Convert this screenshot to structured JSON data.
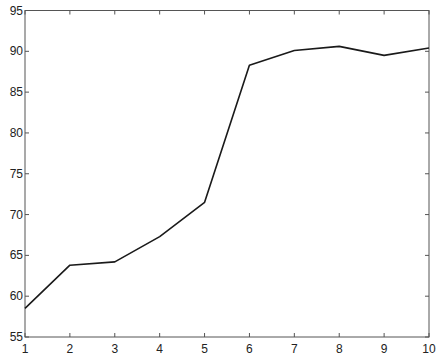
{
  "chart_data": {
    "type": "line",
    "title": "",
    "xlabel": "",
    "ylabel": "",
    "x": [
      1,
      2,
      3,
      4,
      5,
      6,
      7,
      8,
      9,
      10
    ],
    "series": [
      {
        "name": "series-1",
        "values": [
          58.5,
          63.8,
          64.2,
          67.3,
          71.5,
          88.3,
          90.1,
          90.6,
          89.5,
          90.4
        ],
        "color": "#1a1a1a"
      }
    ],
    "xlim": [
      1,
      10
    ],
    "ylim": [
      55,
      95
    ],
    "xticks": [
      1,
      2,
      3,
      4,
      5,
      6,
      7,
      8,
      9,
      10
    ],
    "yticks": [
      55,
      60,
      65,
      70,
      75,
      80,
      85,
      90,
      95
    ],
    "grid": false,
    "legend": null
  },
  "colors": {
    "axis": "#555555",
    "line": "#1a1a1a",
    "background": "#ffffff"
  },
  "caption": {
    "text": ""
  }
}
